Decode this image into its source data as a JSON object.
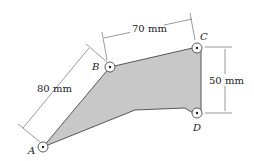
{
  "figure": {
    "points": {
      "A": {
        "label": "A",
        "x": 43,
        "y": 147
      },
      "B": {
        "label": "B",
        "x": 110,
        "y": 67
      },
      "C": {
        "label": "C",
        "x": 197,
        "y": 47
      },
      "D": {
        "label": "D",
        "x": 197,
        "y": 113
      }
    },
    "dimensions": {
      "ab": "80 mm",
      "bc": "70 mm",
      "cd": "50 mm"
    },
    "colors": {
      "plate_fill": "#c8c8c8",
      "outline": "#333333",
      "dimension_line": "#555555"
    }
  }
}
